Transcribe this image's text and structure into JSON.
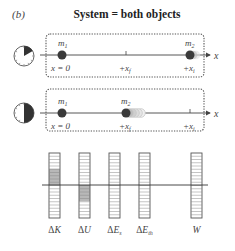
{
  "panel_label": "(b)",
  "title": "System = both objects",
  "axis_label": "x",
  "scene1": {
    "clock": "clock-early-icon",
    "objects": [
      {
        "label": "m",
        "sub": "1",
        "position_label": "x = 0"
      },
      {
        "label": "m",
        "sub": "2",
        "position_label": "+x",
        "position_sub": "i"
      }
    ],
    "tick_label": "+x",
    "tick_sub": "f"
  },
  "scene2": {
    "clock": "clock-half-icon",
    "objects": [
      {
        "label": "m",
        "sub": "1",
        "position_label": "x = 0"
      },
      {
        "label": "m",
        "sub": "2",
        "position_label": "+x",
        "position_sub": "f"
      }
    ],
    "tick_label": "+x",
    "tick_sub": "i"
  },
  "bar_chart": {
    "segments_per_bar": 20,
    "baseline_segment": 10,
    "bars": [
      {
        "label": "ΔK",
        "main": "ΔK",
        "sub": "",
        "shaded_from": 0,
        "shaded_to": 5
      },
      {
        "label": "ΔU",
        "main": "ΔU",
        "sub": "",
        "shaded_from": -5,
        "shaded_to": 0
      },
      {
        "label": "ΔEs",
        "main": "ΔE",
        "sub": "s",
        "shaded_from": 0,
        "shaded_to": 0
      },
      {
        "label": "ΔEth",
        "main": "ΔE",
        "sub": "th",
        "shaded_from": 0,
        "shaded_to": 0
      },
      {
        "label": "W",
        "main": "W",
        "sub": "",
        "shaded_from": 0,
        "shaded_to": 0
      }
    ]
  },
  "colors": {
    "dot": "#3a3a3a",
    "line": "#444444",
    "shade": "#b8b8b8",
    "dashed": "#555555"
  }
}
